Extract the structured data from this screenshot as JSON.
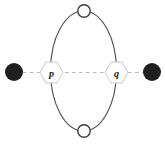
{
  "diagram": {
    "nodes": {
      "p": {
        "label": "p",
        "shape": "hexagon"
      },
      "q": {
        "label": "q",
        "shape": "hexagon"
      }
    },
    "colors": {
      "background": "#ffffff",
      "ellipse_stroke": "#4d4d4d",
      "dashed_line": "#b8b8b8",
      "hexagon_fill": "#ffffff",
      "hexagon_stroke": "#c9c9c9",
      "filled_circle": "#1f1f1f",
      "open_circle_fill": "#ffffff",
      "open_circle_stroke": "#3d3d3d",
      "label_color": "#1a1a1a"
    }
  }
}
